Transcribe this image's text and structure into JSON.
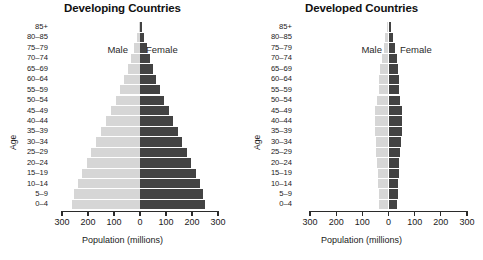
{
  "figure": {
    "axis_title": "Population (millions)",
    "age_axis_label": "Age",
    "series_labels": {
      "male": "Male",
      "female": "Female"
    },
    "colors": {
      "male": "#d6d6d6",
      "female": "#434343",
      "axis": "#2b2b2b",
      "text": "#1a1a1a"
    }
  },
  "chart_data": [
    {
      "type": "bar",
      "subtype": "population-pyramid",
      "title": "Developing Countries",
      "xlabel": "Population (millions)",
      "ylabel": "Age",
      "xlim": [
        -300,
        300
      ],
      "xticks": [
        -300,
        -200,
        -100,
        0,
        100,
        200,
        300
      ],
      "xtick_labels": [
        "300",
        "200",
        "100",
        "0",
        "100",
        "200",
        "300"
      ],
      "grid": false,
      "legend": "in-plot",
      "categories": [
        "0–4",
        "5–9",
        "10–14",
        "15–19",
        "20–24",
        "25–29",
        "30–34",
        "35–39",
        "40–44",
        "45–49",
        "50–54",
        "55–59",
        "60–64",
        "65–69",
        "70–74",
        "75–79",
        "80–85",
        "85+"
      ],
      "series": [
        {
          "name": "Male",
          "values": [
            262,
            255,
            240,
            222,
            205,
            188,
            168,
            150,
            130,
            112,
            94,
            78,
            62,
            48,
            34,
            22,
            12,
            5
          ]
        },
        {
          "name": "Female",
          "values": [
            250,
            244,
            230,
            214,
            198,
            182,
            163,
            146,
            127,
            110,
            93,
            78,
            63,
            50,
            37,
            25,
            14,
            7
          ]
        }
      ]
    },
    {
      "type": "bar",
      "subtype": "population-pyramid",
      "title": "Developed Countries",
      "xlabel": "Population (millions)",
      "ylabel": "Age",
      "xlim": [
        -300,
        300
      ],
      "xticks": [
        -300,
        -200,
        -100,
        0,
        100,
        200,
        300
      ],
      "xtick_labels": [
        "300",
        "200",
        "100",
        "0",
        "100",
        "200",
        "300"
      ],
      "grid": false,
      "legend": "in-plot",
      "categories": [
        "0–4",
        "5–9",
        "10–14",
        "15–19",
        "20–24",
        "25–29",
        "30–34",
        "35–39",
        "40–44",
        "45–49",
        "50–54",
        "55–59",
        "60–64",
        "65–69",
        "70–74",
        "75–79",
        "80–85",
        "85+"
      ],
      "series": [
        {
          "name": "Male",
          "values": [
            36,
            38,
            40,
            42,
            44,
            46,
            48,
            52,
            52,
            50,
            44,
            38,
            36,
            32,
            26,
            19,
            12,
            5
          ]
        },
        {
          "name": "Female",
          "values": [
            34,
            36,
            38,
            40,
            42,
            44,
            46,
            50,
            51,
            50,
            45,
            40,
            39,
            36,
            31,
            25,
            18,
            9
          ]
        }
      ]
    }
  ]
}
